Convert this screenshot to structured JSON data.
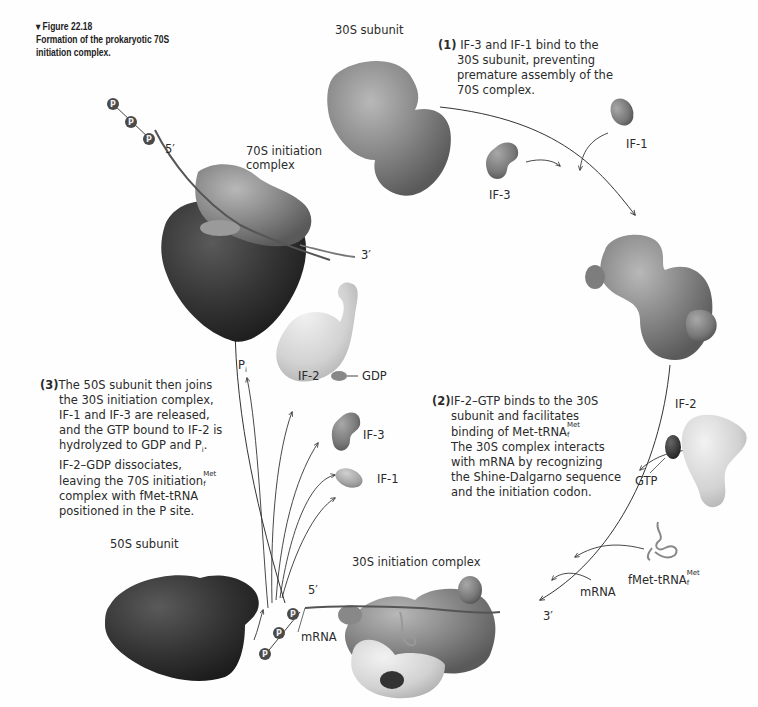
{
  "figure": {
    "number": "▾ Figure 22.18",
    "title": "Formation of the prokaryotic 70S initiation complex."
  },
  "labels": {
    "subunit_30s": "30S subunit",
    "subunit_50s": "50S subunit",
    "complex_70s_line1": "70S initiation",
    "complex_70s_line2": "complex",
    "complex_30s": "30S initiation complex",
    "if1_top": "IF-1",
    "if3_top": "IF-3",
    "if2_right": "IF-2",
    "gtp": "GTP",
    "fmet_trna": "fMet-tRNA",
    "fmet_sup": "Met",
    "fmet_sub": "f",
    "mrna_right": "mRNA",
    "mrna_bottom": "mRNA",
    "five_prime_top": "5′",
    "three_prime_top": "3′",
    "five_prime_bottom": "5′",
    "three_prime_bottom": "3′",
    "if2_left": "IF-2",
    "gdp": "GDP",
    "if3_left": "IF-3",
    "if1_left": "IF-1",
    "pi": "P",
    "pi_sub": "i",
    "phosphate": "P"
  },
  "steps": {
    "step1": {
      "num": "(1)",
      "lines": [
        "IF-3 and IF-1 bind to the",
        "30S subunit, preventing",
        "premature assembly of the",
        "70S complex."
      ]
    },
    "step2": {
      "num": "(2)",
      "line1": "IF-2–GTP binds to the 30S",
      "line2": "subunit and facilitates",
      "line3": "binding of Met-tRNA",
      "line3_sup": "Met",
      "line3_sub": "f",
      "line4": "The 30S complex interacts",
      "line5": "with mRNA by recognizing",
      "line6": "the Shine-Dalgarno sequence",
      "line7": "and the initiation codon."
    },
    "step3": {
      "num": "(3)",
      "line1": "The 50S subunit then joins",
      "line2": "the 30S initiation complex,",
      "line3": "IF-1 and IF-3 are released,",
      "line4": "and the GTP bound to IF-2 is",
      "line5": "hydrolyzed to GDP and P",
      "line5_sub": "i",
      "line5_end": ".",
      "line6": "IF-2–GDP dissociates,",
      "line7": "leaving the 70S initiation",
      "line7_sup": "Met",
      "line7_sub": "f",
      "line8": "complex with fMet-tRNA",
      "line9": "positioned in the P site."
    }
  },
  "colors": {
    "subunit_30s": "#8a8a8a",
    "subunit_50s": "#3a3a3a",
    "if2": "#d6d6d6",
    "arrow": "#333333"
  }
}
